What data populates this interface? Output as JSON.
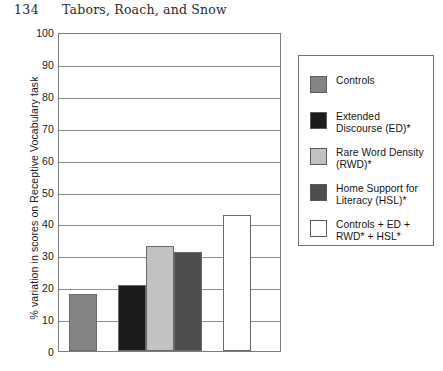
{
  "running_head": {
    "folio": "134",
    "authors": "Tabors, Roach, and Snow"
  },
  "chart_data": {
    "type": "bar",
    "title": "",
    "xlabel": "",
    "ylabel": "% variation in scores on Receptive Vocabulary task",
    "ylim": [
      0,
      100
    ],
    "yticks": [
      0,
      10,
      20,
      30,
      40,
      50,
      60,
      70,
      80,
      90,
      100
    ],
    "ytick_labels": [
      "0",
      "10",
      "20",
      "30",
      "40",
      "50",
      "60",
      "70",
      "80",
      "90",
      "100"
    ],
    "grid": true,
    "legend_position": "right",
    "categories": [
      "Controls",
      "Extended Discourse (ED)*",
      "Rare Word Density (RWD)*",
      "Home Support for Literacy (HSL)*",
      "Controls + ED + RWD* + HSL*"
    ],
    "values": [
      18,
      20.8,
      33,
      31,
      42.5
    ],
    "colors": [
      "#848484",
      "#1b1b1b",
      "#c2c2c2",
      "#4d4d4d",
      "#ffffff"
    ],
    "bars": [
      {
        "label": "Controls",
        "value": 18,
        "color": "#848484",
        "x": 10,
        "width": 28
      },
      {
        "label": "Extended Discourse (ED)*",
        "value": 20.8,
        "color": "#1b1b1b",
        "x": 59,
        "width": 28
      },
      {
        "label": "Rare Word Density (RWD)*",
        "value": 33,
        "color": "#c2c2c2",
        "x": 87,
        "width": 28
      },
      {
        "label": "Home Support for Literacy (HSL)*",
        "value": 31,
        "color": "#4d4d4d",
        "x": 115,
        "width": 28
      },
      {
        "label": "Controls + ED + RWD* + HSL*",
        "value": 42.5,
        "color": "#ffffff",
        "x": 164,
        "width": 28
      }
    ]
  },
  "legend": {
    "items": [
      {
        "label": "Controls",
        "color": "#848484",
        "top": 19
      },
      {
        "label": "Extended\nDiscourse (ED)*",
        "color": "#1b1b1b",
        "top": 55
      },
      {
        "label": "Rare Word Density\n(RWD)*",
        "color": "#c2c2c2",
        "top": 91
      },
      {
        "label": "Home Support for\nLiteracy (HSL)*",
        "color": "#4d4d4d",
        "top": 127
      },
      {
        "label": "Controls + ED +\nRWD* + HSL*",
        "color": "#ffffff",
        "top": 163
      }
    ]
  }
}
